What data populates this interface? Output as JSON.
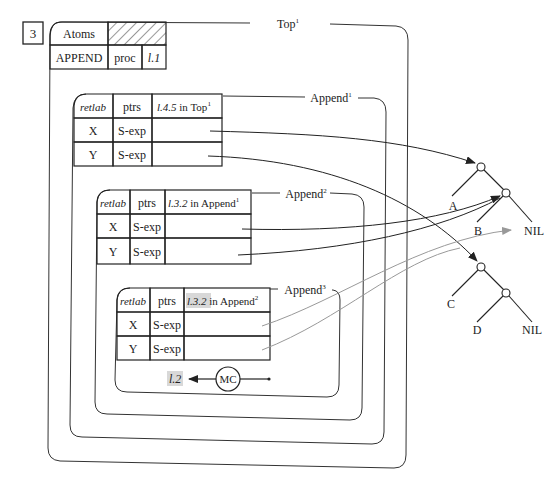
{
  "figure_number": "3",
  "environment": {
    "title": "Top",
    "title_sup": "1",
    "atoms_label": "Atoms",
    "atoms_row": {
      "name": "APPEND",
      "type": "proc",
      "label": "l.1"
    }
  },
  "frames": [
    {
      "title": "Append",
      "title_sup": "1",
      "header": {
        "col1": "retlab",
        "col2": "ptrs",
        "col3_label": "l.4.5",
        "col3_rest": " in Top",
        "col3_sup": "1"
      },
      "rows": [
        {
          "var": "X",
          "type": "S-exp"
        },
        {
          "var": "Y",
          "type": "S-exp"
        }
      ]
    },
    {
      "title": "Append",
      "title_sup": "2",
      "header": {
        "col1": "retlab",
        "col2": "ptrs",
        "col3_label": "l.3.2",
        "col3_rest": " in Append",
        "col3_sup": "1"
      },
      "rows": [
        {
          "var": "X",
          "type": "S-exp"
        },
        {
          "var": "Y",
          "type": "S-exp"
        }
      ]
    },
    {
      "title": "Append",
      "title_sup": "3",
      "header": {
        "col1": "retlab",
        "col2": "ptrs",
        "col3_label": "l.3.2",
        "col3_rest": " in Append",
        "col3_sup": "2"
      },
      "rows": [
        {
          "var": "X",
          "type": "S-exp"
        },
        {
          "var": "Y",
          "type": "S-exp"
        }
      ]
    }
  ],
  "machine_control": {
    "label": "MC",
    "return_label": "l.2"
  },
  "trees": {
    "tree1": {
      "leaves": [
        "A",
        "B",
        "NIL"
      ]
    },
    "tree2": {
      "leaves": [
        "C",
        "D",
        "NIL"
      ]
    }
  },
  "colors": {
    "ink": "#222222",
    "gray_pointer": "#999999",
    "highlight": "#d8d8d8"
  }
}
